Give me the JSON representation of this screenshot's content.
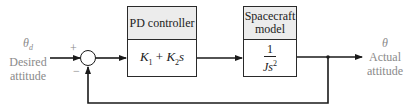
{
  "diagram": {
    "type": "feedback-control-block-diagram",
    "input": {
      "symbol": "θ",
      "subscript": "d",
      "label_line1": "Desired",
      "label_line2": "attitude"
    },
    "output": {
      "symbol": "θ",
      "label_line1": "Actual",
      "label_line2": "attitude"
    },
    "summing_junction": {
      "plus_sign": "+",
      "minus_sign": "−"
    },
    "blocks": [
      {
        "title": "PD controller",
        "transfer_function": {
          "k1": "K",
          "k1_sub": "1",
          "op": " + ",
          "k2": "K",
          "k2_sub": "2",
          "var": "s"
        }
      },
      {
        "title_line1": "Spacecraft",
        "title_line2": "model",
        "transfer_function": {
          "numerator": "1",
          "denominator": "Js",
          "exponent": "2"
        }
      }
    ],
    "colors": {
      "line": "#1a1a1a",
      "header_fill": "#ececec",
      "label_text": "#8a8a8a"
    }
  }
}
